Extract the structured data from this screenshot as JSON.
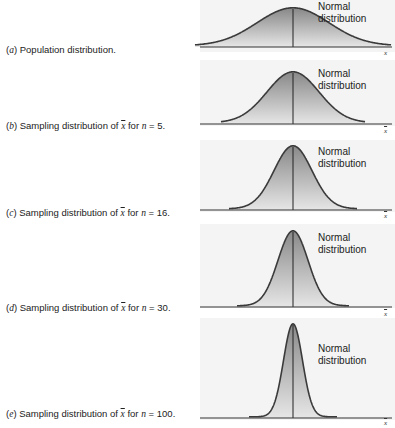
{
  "figure": {
    "curve_label_line1": "Normal",
    "curve_label_line2": "distribution",
    "panels": [
      {
        "letter": "a",
        "prefix": "(",
        "suffix": ") Population distribution.",
        "axis_label": "x",
        "n": null
      },
      {
        "letter": "b",
        "prefix": "(",
        "text_pre": ") Sampling distribution of ",
        "xbar": "x",
        "text_mid": " for ",
        "n_var": "n",
        "text_eq": " = ",
        "n": "5",
        "end": ".",
        "axis_label": "x"
      },
      {
        "letter": "c",
        "prefix": "(",
        "text_pre": ") Sampling distribution of ",
        "xbar": "x",
        "text_mid": " for ",
        "n_var": "n",
        "text_eq": " = ",
        "n": "16",
        "end": ".",
        "axis_label": "x"
      },
      {
        "letter": "d",
        "prefix": "(",
        "text_pre": ") Sampling distribution of ",
        "xbar": "x",
        "text_mid": " for ",
        "n_var": "n",
        "text_eq": " = ",
        "n": "30",
        "end": ".",
        "axis_label": "x"
      },
      {
        "letter": "e",
        "prefix": "(",
        "text_pre": ") Sampling distribution of ",
        "xbar": "x",
        "text_mid": " for ",
        "n_var": "n",
        "text_eq": " = ",
        "n": "100",
        "end": ".",
        "axis_label": "x"
      }
    ]
  },
  "colors": {
    "curve_stroke": "#3a3a3a",
    "fill_top": "#8a8a8a",
    "fill_bottom": "#e6e6e6",
    "axis": "#333333",
    "panel_bg": "#f4f4f4"
  },
  "chart_data": {
    "type": "area",
    "x_center": "mean",
    "grid": false,
    "series": [
      {
        "name": "(a) Population distribution",
        "n": null,
        "relative_sd": 1.0,
        "axis_label": "x",
        "annotation": "Normal distribution"
      },
      {
        "name": "(b) Sampling distribution of x̄ for n = 5",
        "n": 5,
        "relative_sd": 0.447,
        "axis_label": "x̄",
        "annotation": "Normal distribution"
      },
      {
        "name": "(c) Sampling distribution of x̄ for n = 16",
        "n": 16,
        "relative_sd": 0.25,
        "axis_label": "x̄",
        "annotation": "Normal distribution"
      },
      {
        "name": "(d) Sampling distribution of x̄ for n = 30",
        "n": 30,
        "relative_sd": 0.183,
        "axis_label": "x̄",
        "annotation": "Normal distribution"
      },
      {
        "name": "(e) Sampling distribution of x̄ for n = 100",
        "n": 100,
        "relative_sd": 0.1,
        "axis_label": "x̄",
        "annotation": "Normal distribution"
      }
    ]
  }
}
